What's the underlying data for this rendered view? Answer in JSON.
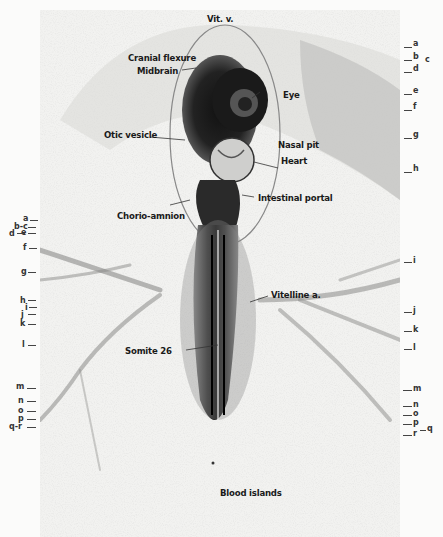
{
  "figure": {
    "type": "embryo-photomicrograph",
    "labels": {
      "vit_v": "Vit. v.",
      "cranial_flexure": "Cranial flexure",
      "midbrain": "Midbrain",
      "eye": "Eye",
      "otic_vesicle": "Otic vesicle",
      "nasal_pit": "Nasal pit",
      "heart": "Heart",
      "intestinal_portal": "Intestinal portal",
      "chorio_amnion": "Chorio-amnion",
      "vitelline_a": "Vitelline a.",
      "somite_26": "Somite 26",
      "blood_islands": "Blood islands"
    },
    "left_levels": [
      {
        "t": "a",
        "y": 219,
        "x": 24
      },
      {
        "t": "b-c",
        "y": 226,
        "x": 14
      },
      {
        "t": "d",
        "y": 232,
        "x": 8
      },
      {
        "t": "e",
        "y": 231,
        "x": 20
      },
      {
        "t": "f",
        "y": 249,
        "x": 22
      },
      {
        "t": "g",
        "y": 272,
        "x": 20
      },
      {
        "t": "h",
        "y": 301,
        "x": 20
      },
      {
        "t": "i",
        "y": 308,
        "x": 25
      },
      {
        "t": "j",
        "y": 315,
        "x": 20
      },
      {
        "t": "k",
        "y": 324,
        "x": 20
      },
      {
        "t": "l",
        "y": 345,
        "x": 22
      },
      {
        "t": "m",
        "y": 388,
        "x": 16
      },
      {
        "t": "n",
        "y": 401,
        "x": 18
      },
      {
        "t": "o",
        "y": 411,
        "x": 18
      },
      {
        "t": "p",
        "y": 419,
        "x": 18
      },
      {
        "t": "q-r",
        "y": 427,
        "x": 9
      }
    ],
    "right_levels": [
      {
        "t": "a",
        "y": 45
      },
      {
        "t": "b",
        "y": 58
      },
      {
        "t": "c",
        "y": 61
      },
      {
        "t": "d",
        "y": 70
      },
      {
        "t": "e",
        "y": 92
      },
      {
        "t": "f",
        "y": 108
      },
      {
        "t": "g",
        "y": 136
      },
      {
        "t": "h",
        "y": 170
      },
      {
        "t": "i",
        "y": 262
      },
      {
        "t": "j",
        "y": 312
      },
      {
        "t": "k",
        "y": 331
      },
      {
        "t": "l",
        "y": 349
      },
      {
        "t": "m",
        "y": 390
      },
      {
        "t": "n",
        "y": 406
      },
      {
        "t": "o",
        "y": 415
      },
      {
        "t": "p",
        "y": 424
      },
      {
        "t": "q",
        "y": 430
      },
      {
        "t": "r",
        "y": 435
      }
    ]
  }
}
